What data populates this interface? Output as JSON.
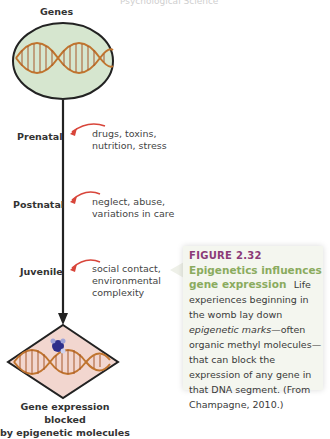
{
  "running_head": "Psychological Science",
  "diagram": {
    "top_label": "Genes",
    "bottom_label_line1": "Gene expression blocked",
    "bottom_label_line2": "by epigenetic molecules",
    "colors": {
      "ellipse_fill": "#d6e6cf",
      "diamond_fill": "#f2d6cf",
      "arrow": "#d8453a",
      "line": "#222222",
      "dna": "#c0742e"
    },
    "stages": [
      {
        "label": "Prenatal",
        "factors_line1": "drugs, toxins,",
        "factors_line2": "nutrition, stress",
        "factors_line3": ""
      },
      {
        "label": "Postnatal",
        "factors_line1": "neglect, abuse,",
        "factors_line2": "variations in care",
        "factors_line3": ""
      },
      {
        "label": "Juvenile",
        "factors_line1": "social contact,",
        "factors_line2": "environmental",
        "factors_line3": "complexity"
      }
    ]
  },
  "caption": {
    "figure_number": "FIGURE 2.32",
    "title": "Epigenetics influences gene expression",
    "body_part1": "Life experiences beginning in the womb lay down ",
    "body_italic": "epigenetic marks",
    "body_part2": "—often organic methyl molecules—that can block the expression of any gene in that DNA segment. (From Champagne, 2010.)"
  }
}
